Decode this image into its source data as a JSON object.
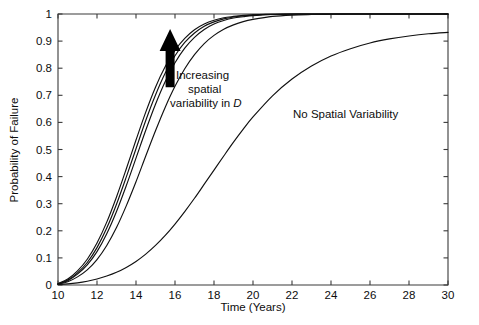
{
  "figure": {
    "background_color": "#ffffff",
    "line_color": "#101010",
    "axis_color": "#3a3a3a",
    "arrow_color": "#000000"
  },
  "annotations": {
    "arrow": {
      "name": "increasing-variability-arrow",
      "direction": "up",
      "x_data": 15.75,
      "y_from": 0.73,
      "y_to": 0.945
    },
    "increasing_label_line1": "Increasing",
    "increasing_label_line2": "spatial",
    "increasing_label_line3_prefix": "variability in ",
    "increasing_label_line3_symbol": "D",
    "no_variability_label": "No Spatial Variability"
  },
  "chart_data": {
    "type": "line",
    "title": "",
    "xlabel": "Time (Years)",
    "ylabel": "Probability of Failure",
    "xlim": [
      10,
      30
    ],
    "ylim": [
      0,
      1
    ],
    "xticks": [
      10,
      12,
      14,
      16,
      18,
      20,
      22,
      24,
      26,
      28,
      30
    ],
    "xtick_labels": [
      "10",
      "12",
      "14",
      "16",
      "18",
      "20",
      "22",
      "24",
      "26",
      "28",
      "30"
    ],
    "yticks": [
      0,
      0.1,
      0.2,
      0.3,
      0.4,
      0.5,
      0.6,
      0.7,
      0.8,
      0.9,
      1
    ],
    "ytick_labels": [
      "0",
      "0.1",
      "0.2",
      "0.3",
      "0.4",
      "0.5",
      "0.6",
      "0.7",
      "0.8",
      "0.9",
      "1"
    ],
    "grid": false,
    "legend_position": "none",
    "x": [
      10,
      10.5,
      11,
      11.5,
      12,
      12.5,
      13,
      13.5,
      14,
      14.5,
      15,
      15.5,
      16,
      16.5,
      17,
      17.5,
      18,
      18.5,
      19,
      19.5,
      20,
      21,
      22,
      23,
      24,
      25,
      26,
      27,
      28,
      29,
      30
    ],
    "series": [
      {
        "name": "Spatial variability level 4 (highest)",
        "annotation": "Increasing spatial variability in D",
        "values": [
          0.005,
          0.022,
          0.052,
          0.095,
          0.155,
          0.232,
          0.325,
          0.428,
          0.535,
          0.638,
          0.73,
          0.806,
          0.866,
          0.91,
          0.942,
          0.963,
          0.977,
          0.986,
          0.991,
          0.995,
          0.997,
          0.999,
          1.0,
          1.0,
          1.0,
          1.0,
          1.0,
          1.0,
          1.0,
          1.0,
          1.0
        ]
      },
      {
        "name": "Spatial variability level 3",
        "annotation": "Increasing spatial variability in D",
        "values": [
          0.004,
          0.018,
          0.045,
          0.083,
          0.138,
          0.21,
          0.298,
          0.398,
          0.503,
          0.607,
          0.701,
          0.782,
          0.846,
          0.895,
          0.93,
          0.955,
          0.971,
          0.982,
          0.989,
          0.993,
          0.996,
          0.999,
          1.0,
          1.0,
          1.0,
          1.0,
          1.0,
          1.0,
          1.0,
          1.0,
          1.0
        ]
      },
      {
        "name": "Spatial variability level 2",
        "annotation": "Increasing spatial variability in D",
        "values": [
          0.004,
          0.016,
          0.04,
          0.074,
          0.123,
          0.189,
          0.271,
          0.366,
          0.468,
          0.571,
          0.667,
          0.751,
          0.82,
          0.874,
          0.914,
          0.943,
          0.963,
          0.976,
          0.985,
          0.99,
          0.994,
          0.998,
          0.999,
          1.0,
          1.0,
          1.0,
          1.0,
          1.0,
          1.0,
          1.0,
          1.0
        ]
      },
      {
        "name": "Spatial variability level 1 (lowest)",
        "annotation": "Increasing spatial variability in D",
        "values": [
          0.003,
          0.012,
          0.03,
          0.056,
          0.094,
          0.146,
          0.212,
          0.292,
          0.381,
          0.476,
          0.569,
          0.656,
          0.733,
          0.798,
          0.85,
          0.891,
          0.921,
          0.944,
          0.96,
          0.972,
          0.98,
          0.991,
          0.996,
          0.998,
          0.999,
          1.0,
          1.0,
          1.0,
          1.0,
          1.0,
          1.0
        ]
      },
      {
        "name": "No Spatial Variability",
        "annotation": "No Spatial Variability",
        "values": [
          0.002,
          0.004,
          0.008,
          0.014,
          0.022,
          0.033,
          0.047,
          0.065,
          0.087,
          0.114,
          0.146,
          0.183,
          0.225,
          0.271,
          0.32,
          0.372,
          0.424,
          0.476,
          0.527,
          0.575,
          0.62,
          0.698,
          0.76,
          0.808,
          0.845,
          0.872,
          0.893,
          0.908,
          0.919,
          0.927,
          0.932
        ]
      }
    ]
  }
}
